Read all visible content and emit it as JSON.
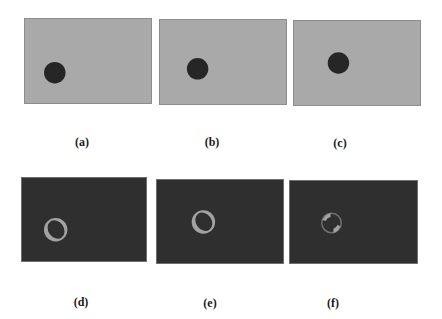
{
  "figure": {
    "colors": {
      "light_bg": "#a9a9a9",
      "dark_bg": "#2f2f2f",
      "disk": "#262626",
      "ring": "#a3a3a3"
    },
    "panels": [
      {
        "id": "a",
        "label": "(a)",
        "type": "frame",
        "x": 24,
        "y": 18,
        "w": 128,
        "h": 86,
        "disk": {
          "cx": 30,
          "cy": 55,
          "r": 11
        },
        "label_x": 82,
        "label_y": 135
      },
      {
        "id": "b",
        "label": "(b)",
        "type": "frame",
        "x": 159,
        "y": 19,
        "w": 128,
        "h": 86,
        "disk": {
          "cx": 38,
          "cy": 50,
          "r": 11
        },
        "label_x": 212,
        "label_y": 135
      },
      {
        "id": "c",
        "label": "(c)",
        "type": "frame",
        "x": 293,
        "y": 20,
        "w": 128,
        "h": 86,
        "disk": {
          "cx": 45,
          "cy": 43,
          "r": 11
        },
        "label_x": 340,
        "label_y": 136
      },
      {
        "id": "d",
        "label": "(d)",
        "type": "difference",
        "x": 21,
        "y": 177,
        "w": 126,
        "h": 85,
        "ring": {
          "cx": 34,
          "cy": 53,
          "r": 12,
          "dx": 3,
          "dy": -3
        },
        "label_x": 81,
        "label_y": 295
      },
      {
        "id": "e",
        "label": "(e)",
        "type": "difference",
        "x": 156,
        "y": 179,
        "w": 128,
        "h": 85,
        "ring": {
          "cx": 47,
          "cy": 43,
          "r": 12,
          "dx": 3,
          "dy": -3
        },
        "label_x": 210,
        "label_y": 296
      },
      {
        "id": "f",
        "label": "(f)",
        "type": "difference-thin",
        "x": 289,
        "y": 180,
        "w": 129,
        "h": 84,
        "ring": {
          "cx": 42,
          "cy": 43,
          "r": 11
        },
        "label_x": 333,
        "label_y": 296
      }
    ]
  }
}
